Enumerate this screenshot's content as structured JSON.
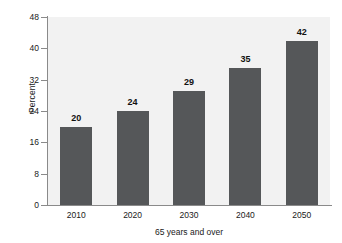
{
  "chart_data": {
    "type": "bar",
    "title": "",
    "xlabel": "65 years and over",
    "ylabel": "Percent",
    "categories": [
      "2010",
      "2020",
      "2030",
      "2040",
      "2050"
    ],
    "values": [
      20,
      24,
      29,
      35,
      42
    ],
    "data_labels": [
      "20",
      "24",
      "29",
      "35",
      "42"
    ],
    "ylim": [
      0,
      48
    ],
    "yticks": [
      0,
      8,
      16,
      24,
      32,
      40,
      48
    ],
    "ytick_labels": [
      "0",
      "8",
      "16",
      "24",
      "32",
      "40",
      "48"
    ],
    "grid": false,
    "legend": null,
    "bar_color": "#555759",
    "plot_background": "#f2f2f2",
    "axis_color": "#8a8a8a",
    "text_color": "#1a1a1a"
  }
}
